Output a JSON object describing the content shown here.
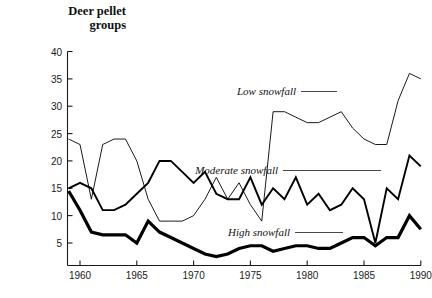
{
  "title": {
    "line1": "Deer pellet",
    "line2": "groups"
  },
  "chart_data": {
    "type": "line",
    "xlabel": "",
    "ylabel": "Deer pellet groups",
    "xlim": [
      1958.5,
      1991
    ],
    "ylim": [
      0,
      40
    ],
    "yticks": [
      5,
      10,
      15,
      20,
      25,
      30,
      35,
      40
    ],
    "xticks": [
      1960,
      1965,
      1970,
      1975,
      1980,
      1985,
      1990
    ],
    "grid": false,
    "legend_position": "inline-annotations",
    "x": [
      1959,
      1960,
      1961,
      1962,
      1963,
      1964,
      1965,
      1966,
      1967,
      1968,
      1969,
      1970,
      1971,
      1972,
      1973,
      1974,
      1975,
      1976,
      1977,
      1978,
      1979,
      1980,
      1981,
      1982,
      1983,
      1984,
      1985,
      1986,
      1987,
      1988,
      1989,
      1990
    ],
    "series": [
      {
        "name": "Low snowfall",
        "label": "Low snowfall",
        "line_weight": "thin",
        "color": "#000000",
        "values": [
          24,
          23,
          13,
          23,
          24,
          24,
          20,
          13,
          9,
          9,
          9,
          10,
          13,
          17,
          13,
          16,
          12,
          9,
          29,
          29,
          28,
          27,
          27,
          28,
          29,
          26,
          24,
          23,
          23,
          31,
          36,
          35
        ]
      },
      {
        "name": "Moderate snowfall",
        "label": "Moderate snowfall",
        "line_weight": "medium",
        "color": "#000000",
        "values": [
          15,
          16,
          15,
          11,
          11,
          12,
          14,
          16,
          20,
          20,
          18,
          16,
          18,
          14,
          13,
          13,
          17,
          12,
          15,
          13,
          17,
          12,
          14,
          11,
          12,
          15,
          13,
          5,
          15,
          13,
          21,
          19
        ]
      },
      {
        "name": "High snowfall",
        "label": "High snowfall",
        "line_weight": "thick",
        "color": "#000000",
        "values": [
          14.5,
          11,
          7,
          6.5,
          6.5,
          6.5,
          5,
          9,
          7,
          6,
          5,
          4,
          3,
          2.5,
          3,
          4,
          4.5,
          4.5,
          3.5,
          4,
          4.5,
          4.5,
          4,
          4,
          5,
          6,
          6,
          4.5,
          6,
          6,
          10,
          7.5
        ]
      }
    ]
  },
  "annotations": [
    {
      "name": "low-snowfall-label",
      "text": "Low snowfall"
    },
    {
      "name": "moderate-snowfall-label",
      "text": "Moderate snowfall"
    },
    {
      "name": "high-snowfall-label",
      "text": "High snowfall"
    }
  ]
}
